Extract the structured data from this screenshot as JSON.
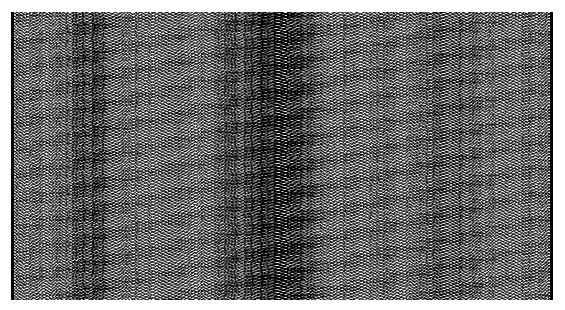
{
  "figure": {
    "kind": "seismic-wiggle-trace-section",
    "width_px": 565,
    "height_px": 310,
    "background_color": "#ffffff",
    "trace_color": "#000000",
    "has_visible_text": false,
    "has_axis_tick_labels": false,
    "has_legend": false,
    "has_title": false
  },
  "panel": {
    "left_px": 11,
    "top_px": 12,
    "width_px": 542,
    "height_px": 288,
    "left_spine_color": "#000000",
    "right_spine_color": "#000000",
    "spine_width_px": 3,
    "top_spine_visible": false,
    "bottom_spine_visible": false
  },
  "chart_data": {
    "type": "line",
    "title": "",
    "subtitle": "",
    "xlabel": "",
    "ylabel": "",
    "grid": false,
    "legend_position": "none",
    "orientation": "vertical-traces",
    "render_style": "wiggle-trace-variable-area",
    "xlim": [
      0,
      164
    ],
    "ylim": [
      0,
      512
    ],
    "x_tick_labels": [],
    "y_tick_labels": [],
    "trace_count": 164,
    "samples_per_trace": 512,
    "trace_spacing_px": 3.3,
    "wiggle_half_amplitude_px": 2.6,
    "fill_positive_lobes": true,
    "anomaly_bands": [
      {
        "name": "central-high-amplitude-band",
        "x_start_trace": 72,
        "x_end_trace": 92,
        "relative_darkness": 1.45,
        "relative_amplitude": 1.35,
        "description": "dense dark vertical band near center of section"
      },
      {
        "name": "left-moderate-band",
        "x_start_trace": 18,
        "x_end_trace": 30,
        "relative_darkness": 1.12,
        "relative_amplitude": 1.08,
        "description": "mild amplitude increase left of center"
      },
      {
        "name": "right-moderate-band",
        "x_start_trace": 126,
        "x_end_trace": 140,
        "relative_darkness": 1.1,
        "relative_amplitude": 1.06,
        "description": "mild amplitude increase right of center"
      }
    ],
    "series": [
      {
        "name": "dominant-oscillation",
        "description": "primary high-frequency vertical oscillation along each trace",
        "frequency_cycles_per_panel_height": 96,
        "amplitude_normalized": 1.0,
        "phase_drift_per_trace_rad": 0.62
      },
      {
        "name": "secondary-modulation",
        "description": "slower amplitude envelope modulating trace darkness down-section",
        "frequency_cycles_per_panel_height": 11,
        "amplitude_normalized": 0.38,
        "phase_drift_per_trace_rad": 0.17
      },
      {
        "name": "lateral-coherence",
        "description": "cross-trace coherent event producing horizontal alignment of peaks",
        "frequency_cycles_per_panel_height": 34,
        "amplitude_normalized": 0.26,
        "phase_drift_per_trace_rad": -0.09
      },
      {
        "name": "noise-floor",
        "description": "random high-frequency jitter superimposed on all traces",
        "amplitude_normalized": 0.22
      }
    ],
    "amplitude_envelope_by_trace_percent": [
      62,
      64,
      66,
      63,
      61,
      65,
      68,
      70,
      67,
      64,
      62,
      60,
      63,
      66,
      69,
      72,
      74,
      76,
      79,
      82,
      85,
      86,
      84,
      83,
      85,
      87,
      86,
      84,
      81,
      78,
      75,
      72,
      70,
      68,
      66,
      65,
      67,
      69,
      71,
      70,
      68,
      66,
      64,
      63,
      65,
      67,
      70,
      73,
      75,
      74,
      72,
      70,
      68,
      66,
      64,
      62,
      61,
      63,
      66,
      69,
      72,
      75,
      78,
      81,
      84,
      87,
      90,
      92,
      94,
      96,
      97,
      98,
      100,
      100,
      99,
      98,
      100,
      100,
      99,
      97,
      96,
      98,
      100,
      100,
      98,
      96,
      94,
      92,
      90,
      87,
      84,
      81,
      78,
      75,
      72,
      69,
      67,
      65,
      64,
      66,
      68,
      70,
      72,
      71,
      69,
      67,
      65,
      64,
      66,
      68,
      70,
      72,
      74,
      73,
      71,
      69,
      67,
      65,
      64,
      63,
      65,
      67,
      69,
      71,
      73,
      76,
      78,
      80,
      82,
      81,
      79,
      77,
      75,
      73,
      71,
      73,
      75,
      77,
      76,
      74,
      72,
      70,
      68,
      66,
      65,
      67,
      69,
      71,
      70,
      68,
      66,
      64,
      63,
      65,
      67,
      69,
      71,
      70,
      68,
      66,
      65,
      64,
      66,
      68
    ]
  }
}
